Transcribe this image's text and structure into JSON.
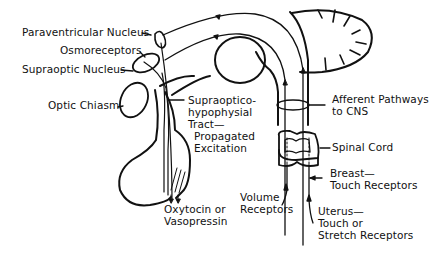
{
  "diagram": {
    "type": "neuroendocrine-reflex-pathway",
    "structures": [
      "hypothalamus",
      "pituitary",
      "cerebellum",
      "brainstem",
      "spinal-cord"
    ],
    "labels": {
      "paraventricular": "Paraventricular Nucleus",
      "osmoreceptors": "Osmoreceptors",
      "supraoptic": "Supraoptic Nucleus",
      "optic_chiasm": "Optic Chiasm",
      "tract_1": "Supraoptico-",
      "tract_2": "hypophysial",
      "tract_3": "Tract—",
      "tract_4": "Propagated",
      "tract_5": "Excitation",
      "hormone_1": "Oxytocin or",
      "hormone_2": "Vasopressin",
      "afferent_1": "Afferent Pathways",
      "afferent_2": "to CNS",
      "spinal_cord": "Spinal Cord",
      "breast_1": "Breast—",
      "breast_2": "Touch Receptors",
      "volume_1": "Volume",
      "volume_2": "Receptors",
      "uterus_1": "Uterus—",
      "uterus_2": "Touch or",
      "uterus_3": "Stretch Receptors"
    },
    "colors": {
      "line": "#111111",
      "background": "#ffffff"
    }
  }
}
